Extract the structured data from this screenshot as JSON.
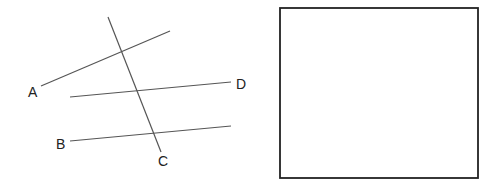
{
  "diagram": {
    "labels": {
      "A": "A",
      "B": "B",
      "C": "C",
      "D": "D"
    },
    "lines": [
      {
        "name": "line-a",
        "x1": 41,
        "y1": 86,
        "x2": 170,
        "y2": 31
      },
      {
        "name": "line-d",
        "x1": 70,
        "y1": 97,
        "x2": 231,
        "y2": 82
      },
      {
        "name": "line-b",
        "x1": 70,
        "y1": 141,
        "x2": 231,
        "y2": 126
      },
      {
        "name": "transversal-c",
        "x1": 108,
        "y1": 17,
        "x2": 161,
        "y2": 152
      }
    ],
    "answer_box": {
      "x": 280,
      "y": 8,
      "width": 198,
      "height": 170
    },
    "colors": {
      "line": "#555555",
      "box": "#222222",
      "text": "#222222"
    }
  }
}
